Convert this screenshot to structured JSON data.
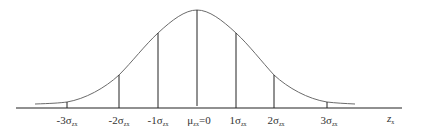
{
  "diagram": {
    "axis_label": {
      "main": "z",
      "sub": "x"
    },
    "colors": {
      "curve": "#6b6b6b",
      "lines": "#222222",
      "text": "#333333"
    },
    "markers": [
      {
        "id": "m3",
        "prefix": "-3",
        "symbol": "σ",
        "sub": "zx",
        "x": 67
      },
      {
        "id": "m2",
        "prefix": "-2",
        "symbol": "σ",
        "sub": "zx",
        "x": 119
      },
      {
        "id": "m1",
        "prefix": "-1",
        "symbol": "σ",
        "sub": "zx",
        "x": 158
      },
      {
        "id": "mu",
        "prefix": "",
        "symbol": "μ",
        "sub": "zx",
        "suffix": "=0",
        "x": 197
      },
      {
        "id": "p1",
        "prefix": "1",
        "symbol": "σ",
        "sub": "zx",
        "x": 236
      },
      {
        "id": "p2",
        "prefix": "2",
        "symbol": "σ",
        "sub": "zx",
        "x": 274
      },
      {
        "id": "p3",
        "prefix": "3",
        "symbol": "σ",
        "sub": "zx",
        "x": 327
      }
    ]
  }
}
